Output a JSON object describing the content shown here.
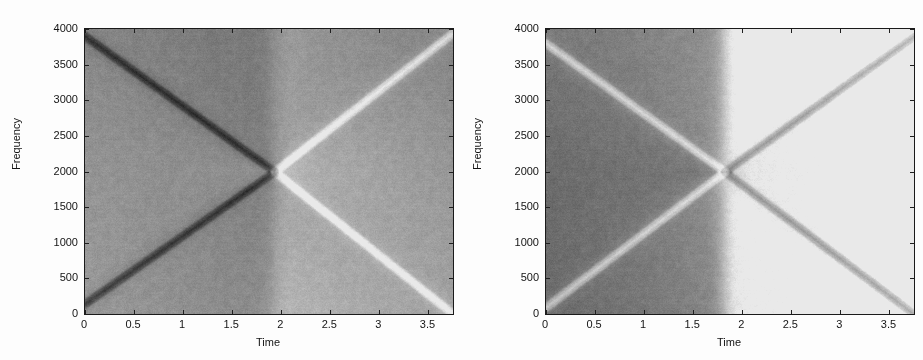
{
  "figure": {
    "background_color": "#fdfdfd",
    "axis_color": "#1a1a1a",
    "panel_count": 2
  },
  "panels": [
    {
      "id": "left",
      "name": "tfd-plot-left",
      "xlabel": "Time",
      "ylabel": "Frequency",
      "xticks": [
        "0",
        "0.5",
        "1",
        "1.5",
        "2",
        "2.5",
        "3",
        "3.5"
      ],
      "yticks": [
        "0",
        "500",
        "1000",
        "1500",
        "2000",
        "2500",
        "3000",
        "3500",
        "4000"
      ]
    },
    {
      "id": "right",
      "name": "tfd-plot-right",
      "xlabel": "Time",
      "ylabel": "Frequency",
      "xticks": [
        "0",
        "0.5",
        "1",
        "1.5",
        "2",
        "2.5",
        "3",
        "3.5"
      ],
      "yticks": [
        "0",
        "500",
        "1000",
        "1500",
        "2000",
        "2500",
        "3000",
        "3500",
        "4000"
      ]
    }
  ],
  "chart_data": [
    {
      "type": "heatmap",
      "title": "",
      "subtitle": "",
      "xlabel": "Time",
      "ylabel": "Frequency",
      "xlim": [
        0,
        3.75
      ],
      "ylim": [
        0,
        4000
      ],
      "xticks": [
        0,
        0.5,
        1,
        1.5,
        2,
        2.5,
        3,
        3.5
      ],
      "yticks": [
        0,
        500,
        1000,
        1500,
        2000,
        2500,
        3000,
        3500,
        4000
      ],
      "grid": false,
      "legend": "none",
      "colormap": "gray",
      "panel": "left",
      "description": "Time-frequency distribution of two crossing chirps; X-shaped instantaneous-frequency ridges intersect near t=1.93, f=2000",
      "components": [
        {
          "name": "descending-chirp",
          "kind": "line-ridge",
          "polarity": "dark",
          "t_start": 0.0,
          "f_start": 3900,
          "t_end": 3.75,
          "f_end": 0,
          "kink_t": 1.93,
          "kink_f": 2000
        },
        {
          "name": "ascending-chirp",
          "kind": "line-ridge",
          "polarity": "dark",
          "t_start": 0.0,
          "f_start": 150,
          "t_end": 3.75,
          "f_end": 3950,
          "kink_t": 1.93,
          "kink_f": 2000
        },
        {
          "name": "descending-chirp-post-crossing",
          "kind": "line-ridge",
          "polarity": "bright",
          "t_start": 1.93,
          "f_start": 2000,
          "t_end": 3.75,
          "f_end": 0
        },
        {
          "name": "ascending-chirp-post-crossing",
          "kind": "line-ridge",
          "polarity": "bright",
          "t_start": 1.93,
          "f_start": 2100,
          "t_end": 3.75,
          "f_end": 3950
        }
      ],
      "background_regions": [
        {
          "quadrant": "upper-left",
          "level": 0.52
        },
        {
          "quadrant": "lower-left",
          "level": 0.62
        },
        {
          "quadrant": "upper-right",
          "level": 0.34
        },
        {
          "quadrant": "lower-right",
          "level": 0.46
        }
      ]
    },
    {
      "type": "heatmap",
      "title": "",
      "subtitle": "",
      "xlabel": "Time",
      "ylabel": "Frequency",
      "xlim": [
        0,
        3.75
      ],
      "ylim": [
        0,
        4000
      ],
      "xticks": [
        0,
        0.5,
        1,
        1.5,
        2,
        2.5,
        3,
        3.5
      ],
      "yticks": [
        0,
        500,
        1000,
        1500,
        2000,
        2500,
        3000,
        3500,
        4000
      ],
      "grid": false,
      "legend": "none",
      "colormap": "gray",
      "panel": "right",
      "description": "Time-frequency distribution of the same crossing chirps with inverted ridge contrast; ridges intersect near t=1.82, f=2000",
      "components": [
        {
          "name": "descending-chirp",
          "kind": "line-ridge",
          "polarity": "bright",
          "t_start": 0.0,
          "f_start": 3800,
          "t_end": 3.75,
          "f_end": 0,
          "kink_t": 1.82,
          "kink_f": 2000
        },
        {
          "name": "ascending-chirp",
          "kind": "line-ridge",
          "polarity": "bright",
          "t_start": 0.0,
          "f_start": 100,
          "t_end": 3.75,
          "f_end": 3900,
          "kink_t": 1.82,
          "kink_f": 2000
        },
        {
          "name": "ascending-chirp-post-crossing",
          "kind": "line-ridge",
          "polarity": "dark",
          "t_start": 1.82,
          "f_start": 2000,
          "t_end": 3.75,
          "f_end": 3850
        },
        {
          "name": "descending-chirp-post-crossing",
          "kind": "line-ridge",
          "polarity": "dark",
          "t_start": 1.82,
          "f_start": 1950,
          "t_end": 3.75,
          "f_end": 150
        }
      ],
      "background_regions": [
        {
          "quadrant": "upper-left",
          "level": 0.44
        },
        {
          "quadrant": "lower-left",
          "level": 0.36
        },
        {
          "quadrant": "upper-right",
          "level": 0.6
        },
        {
          "quadrant": "lower-right",
          "level": 0.58
        }
      ]
    }
  ]
}
